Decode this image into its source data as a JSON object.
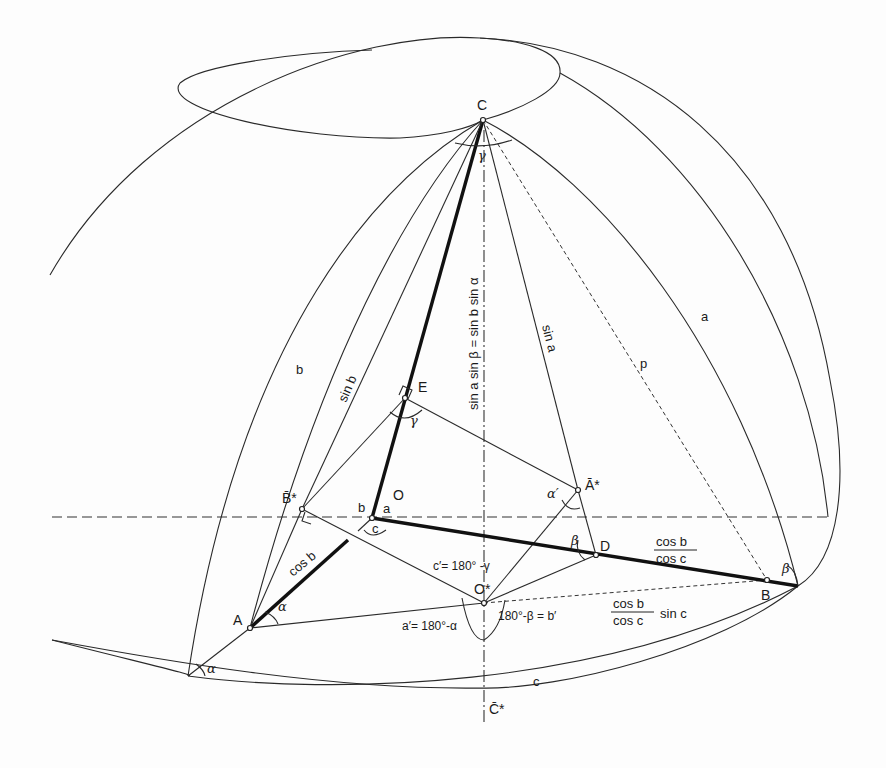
{
  "figure": {
    "points": {
      "C": "C",
      "E": "E",
      "O": "O",
      "B_star": "B̄*",
      "A_star": "Ā*",
      "D": "D",
      "O_star": "O*",
      "A": "A",
      "B": "B",
      "C_star": "C̄*"
    },
    "arcs": {
      "a": "a",
      "b": "b",
      "c": "c"
    },
    "segment_labels": {
      "sin_b": "sin b",
      "sin_a": "sin a",
      "cos_b": "cos b",
      "p": "p",
      "vertical_eq": "sin a  sin β = sin b  sin α",
      "cosb_over_cosc_num": "cos b",
      "cosb_over_cosc_den": "cos c",
      "cosb_cosc_sinc_num": "cos b",
      "cosb_cosc_sinc_den": "cos c",
      "cosb_cosc_sinc_suffix": "sin c"
    },
    "angles": {
      "gamma_C": "γ",
      "gamma_E": "γ",
      "alpha_A": "α",
      "alpha_bottom": "α",
      "alpha_prime": "α′",
      "beta_D": "β",
      "beta_B": "β",
      "center_a": "a",
      "center_b": "b",
      "center_c": "c"
    },
    "formulas": {
      "c_prime": "c′= 180° -γ",
      "a_prime": "a′= 180°-α",
      "b_prime": "180°-β = b′"
    }
  }
}
